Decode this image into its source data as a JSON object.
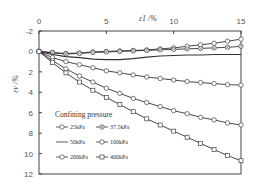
{
  "chart_data": {
    "type": "line",
    "title": "",
    "xlabel": "ε1 /%",
    "ylabel": "εv /%",
    "xlim": [
      0,
      15
    ],
    "ylim": [
      -2,
      12
    ],
    "y_inverted": true,
    "x_axis_position": "top",
    "x_ticks": [
      "0",
      "5",
      "10",
      "15"
    ],
    "y_ticks": [
      "-2",
      "0",
      "2",
      "4",
      "6",
      "8",
      "10",
      "12"
    ],
    "legend_title": "Confining pressure",
    "legend_position": "lower-left inside",
    "x": [
      0,
      1,
      2,
      3,
      4,
      5,
      6,
      7,
      8,
      9,
      10,
      11,
      12,
      13,
      14,
      15
    ],
    "series": [
      {
        "name": "25kPa",
        "marker": "circle",
        "values": [
          0,
          0.1,
          0.2,
          0.15,
          0.05,
          0,
          -0.05,
          -0.1,
          -0.15,
          -0.25,
          -0.35,
          -0.5,
          -0.65,
          -0.8,
          -1.0,
          -1.2
        ]
      },
      {
        "name": "37.5kPa",
        "marker": "x-circle",
        "values": [
          0,
          0.15,
          0.25,
          0.2,
          0.1,
          0.05,
          0,
          -0.05,
          -0.1,
          -0.15,
          -0.2,
          -0.25,
          -0.3,
          -0.35,
          -0.4,
          -0.5
        ]
      },
      {
        "name": "50kPa",
        "marker": "none",
        "values": [
          0,
          0.3,
          0.5,
          0.6,
          0.75,
          0.8,
          0.8,
          0.7,
          0.55,
          0.45,
          0.4,
          0.35,
          0.35,
          0.3,
          0.3,
          0.3
        ]
      },
      {
        "name": "100kPa",
        "marker": "circle",
        "values": [
          0,
          0.6,
          1.0,
          1.3,
          1.6,
          1.9,
          2.1,
          2.3,
          2.5,
          2.65,
          2.8,
          2.95,
          3.05,
          3.15,
          3.25,
          3.3
        ]
      },
      {
        "name": "200kPa",
        "marker": "circle",
        "values": [
          0,
          0.9,
          1.7,
          2.4,
          3.0,
          3.6,
          4.1,
          4.6,
          5.0,
          5.4,
          5.8,
          6.1,
          6.45,
          6.7,
          7.0,
          7.2
        ]
      },
      {
        "name": "400kPa",
        "marker": "square",
        "values": [
          0,
          1.1,
          2.1,
          3.0,
          3.8,
          4.5,
          5.2,
          5.9,
          6.6,
          7.2,
          7.8,
          8.4,
          9.0,
          9.6,
          10.2,
          10.7
        ]
      }
    ]
  }
}
